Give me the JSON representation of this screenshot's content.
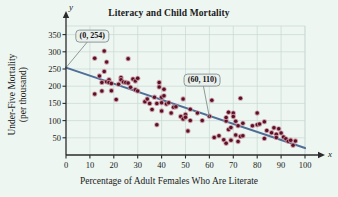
{
  "chart_data": {
    "type": "scatter",
    "title": "Literacy and Child Mortality",
    "xlabel": "Percentage of Adult Females Who Are Literate",
    "ylabel_line1": "Under-Five Mortality",
    "ylabel_line2": "(per thousand)",
    "x_axis_letter": "x",
    "y_axis_letter": "y",
    "xlim": [
      0,
      100
    ],
    "ylim": [
      0,
      375
    ],
    "xticks": [
      0,
      10,
      20,
      30,
      40,
      50,
      60,
      70,
      80,
      90,
      100
    ],
    "yticks": [
      50,
      100,
      150,
      200,
      250,
      300,
      350
    ],
    "grid": true,
    "legend": "none",
    "point_color": "#5c1026",
    "point_halo_color": "#c8919e",
    "line_color": "#4f6f96",
    "grid_color": "#c9d8d2",
    "axis_color": "#2b2b2b",
    "background_color": "#edf6f1",
    "callout_fill": "#e9f0ee",
    "callout_border": "#8d9a97",
    "annotations": [
      {
        "label": "(0, 254)",
        "point_x": 0,
        "point_y": 254,
        "box_x": 11,
        "box_y": 346
      },
      {
        "label": "(60, 110)",
        "point_x": 60,
        "point_y": 110,
        "box_x": 57,
        "box_y": 218
      }
    ],
    "trendline": {
      "name": "least-squares regression line",
      "x_start": 0,
      "y_start": 254,
      "x_end": 100,
      "y_end": 20
    },
    "series": [
      {
        "name": "Countries",
        "points": [
          [
            12,
            177
          ],
          [
            12,
            281
          ],
          [
            14,
            230
          ],
          [
            15,
            186
          ],
          [
            15,
            211
          ],
          [
            16,
            302
          ],
          [
            16,
            243
          ],
          [
            17,
            270
          ],
          [
            17,
            213
          ],
          [
            18,
            219
          ],
          [
            18,
            211
          ],
          [
            19,
            208
          ],
          [
            19,
            187
          ],
          [
            21,
            161
          ],
          [
            22,
            206
          ],
          [
            23,
            225
          ],
          [
            23,
            219
          ],
          [
            24,
            212
          ],
          [
            25,
            211
          ],
          [
            26,
            280
          ],
          [
            26,
            209
          ],
          [
            27,
            197
          ],
          [
            28,
            221
          ],
          [
            29,
            215
          ],
          [
            29,
            190
          ],
          [
            30,
            223
          ],
          [
            30,
            186
          ],
          [
            33,
            155
          ],
          [
            34,
            163
          ],
          [
            35,
            150
          ],
          [
            36,
            132
          ],
          [
            37,
            168
          ],
          [
            38,
            88
          ],
          [
            38,
            150
          ],
          [
            39,
            211
          ],
          [
            39,
            198
          ],
          [
            40,
            168
          ],
          [
            40,
            152
          ],
          [
            40,
            128
          ],
          [
            41,
            191
          ],
          [
            41,
            172
          ],
          [
            42,
            148
          ],
          [
            43,
            152
          ],
          [
            44,
            122
          ],
          [
            45,
            139
          ],
          [
            46,
            140
          ],
          [
            48,
            112
          ],
          [
            49,
            105
          ],
          [
            49,
            163
          ],
          [
            50,
            118
          ],
          [
            50,
            110
          ],
          [
            51,
            70
          ],
          [
            52,
            133
          ],
          [
            52,
            100
          ],
          [
            55,
            122
          ],
          [
            57,
            100
          ],
          [
            60,
            113
          ],
          [
            61,
            159
          ],
          [
            62,
            51
          ],
          [
            64,
            56
          ],
          [
            66,
            44
          ],
          [
            67,
            99
          ],
          [
            67,
            109
          ],
          [
            67,
            34
          ],
          [
            68,
            124
          ],
          [
            68,
            74
          ],
          [
            69,
            80
          ],
          [
            69,
            43
          ],
          [
            70,
            122
          ],
          [
            70,
            112
          ],
          [
            71,
            98
          ],
          [
            71,
            58
          ],
          [
            72,
            85
          ],
          [
            72,
            39
          ],
          [
            73,
            165
          ],
          [
            73,
            54
          ],
          [
            74,
            56
          ],
          [
            74,
            92
          ],
          [
            78,
            85
          ],
          [
            80,
            122
          ],
          [
            80,
            88
          ],
          [
            81,
            90
          ],
          [
            83,
            48
          ],
          [
            83,
            97
          ],
          [
            84,
            71
          ],
          [
            86,
            65
          ],
          [
            87,
            79
          ],
          [
            88,
            60
          ],
          [
            88,
            51
          ],
          [
            89,
            76
          ],
          [
            90,
            64
          ],
          [
            91,
            52
          ],
          [
            92,
            47
          ],
          [
            93,
            40
          ],
          [
            94,
            43
          ],
          [
            95,
            28
          ],
          [
            96,
            41
          ]
        ]
      }
    ]
  }
}
